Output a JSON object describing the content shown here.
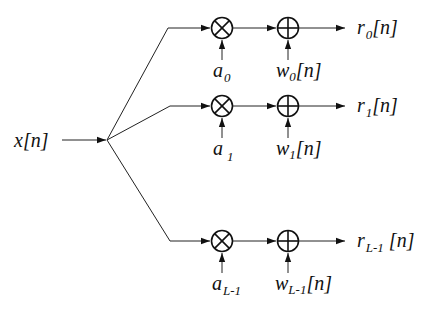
{
  "diagram": {
    "type": "signal-flow",
    "input": {
      "label": "x[n]",
      "base": "x",
      "suffix": "[n]"
    },
    "branches": [
      {
        "id": "branch-0",
        "y": 28,
        "gain": {
          "base": "a",
          "sub": "0"
        },
        "noise": {
          "base": "w",
          "sub": "0",
          "suffix": "[n]"
        },
        "output": {
          "base": "r",
          "sub": "0",
          "suffix": "[n]"
        }
      },
      {
        "id": "branch-1",
        "y": 106,
        "gain": {
          "base": "a",
          "sub": "1"
        },
        "noise": {
          "base": "w",
          "sub": "1",
          "suffix": "[n]"
        },
        "output": {
          "base": "r",
          "sub": "1",
          "suffix": "[n]"
        }
      },
      {
        "id": "branch-L-1",
        "y": 241,
        "gain": {
          "base": "a",
          "sub": "L-1"
        },
        "noise": {
          "base": "w",
          "sub": "L-1",
          "suffix": "[n]"
        },
        "output": {
          "base": "r",
          "sub": "L-1",
          "suffix": " [n]"
        }
      }
    ],
    "node_types": {
      "multiplier": "circle-times-icon",
      "adder": "circle-plus-icon"
    }
  }
}
